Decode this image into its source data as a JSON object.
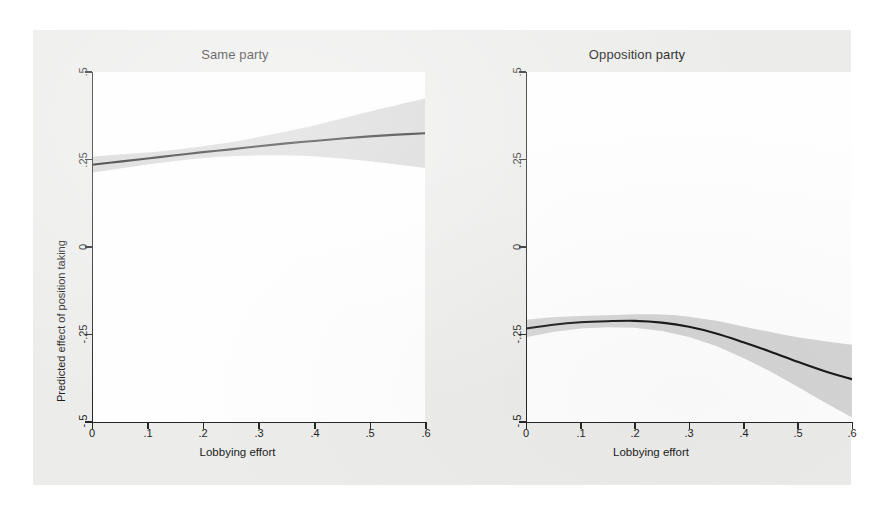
{
  "figure": {
    "background_color": "#ececeb",
    "plot_background_color": "#fefefe",
    "line_color": "#1a1a1a",
    "band_color": "#c9c9c9"
  },
  "chart_data": {
    "type": "line",
    "title": "",
    "subplots": [
      {
        "title": "Same party",
        "xlabel": "Lobbying effort",
        "ylabel": "Predicted effect of position taking",
        "xlim": [
          0,
          0.6
        ],
        "ylim": [
          -0.5,
          0.5
        ],
        "xticks": [
          0,
          0.1,
          0.2,
          0.3,
          0.4,
          0.5,
          0.6
        ],
        "xticklabels": [
          "0",
          ".1",
          ".2",
          ".3",
          ".4",
          ".5",
          ".6"
        ],
        "yticks": [
          -0.5,
          -0.25,
          0,
          0.25,
          0.5
        ],
        "yticklabels": [
          "-.5",
          "-.25",
          "0",
          ".25",
          ".5"
        ],
        "grid": false,
        "series": [
          {
            "name": "Predicted effect",
            "x": [
              0,
              0.05,
              0.1,
              0.15,
              0.2,
              0.25,
              0.3,
              0.35,
              0.4,
              0.45,
              0.5,
              0.55,
              0.6
            ],
            "values": [
              0.235,
              0.244,
              0.253,
              0.262,
              0.271,
              0.279,
              0.288,
              0.296,
              0.303,
              0.31,
              0.316,
              0.321,
              0.325
            ],
            "ci_lower": [
              0.212,
              0.224,
              0.236,
              0.246,
              0.254,
              0.259,
              0.262,
              0.262,
              0.259,
              0.253,
              0.245,
              0.236,
              0.226
            ],
            "ci_upper": [
              0.258,
              0.264,
              0.27,
              0.278,
              0.288,
              0.299,
              0.314,
              0.33,
              0.347,
              0.367,
              0.387,
              0.406,
              0.424
            ]
          }
        ]
      },
      {
        "title": "Opposition party",
        "xlabel": "Lobbying effort",
        "ylabel": "",
        "xlim": [
          0,
          0.6
        ],
        "ylim": [
          -0.5,
          0.5
        ],
        "xticks": [
          0,
          0.1,
          0.2,
          0.3,
          0.4,
          0.5,
          0.6
        ],
        "xticklabels": [
          "0",
          ".1",
          ".2",
          ".3",
          ".4",
          ".5",
          ".6"
        ],
        "yticks": [
          -0.5,
          -0.25,
          0,
          0.25,
          0.5
        ],
        "yticklabels": [
          "-.5",
          "-.25",
          "0",
          ".25",
          ".5"
        ],
        "grid": false,
        "series": [
          {
            "name": "Predicted effect",
            "x": [
              0,
              0.05,
              0.1,
              0.15,
              0.2,
              0.25,
              0.3,
              0.35,
              0.4,
              0.45,
              0.5,
              0.55,
              0.6
            ],
            "values": [
              -0.233,
              -0.222,
              -0.215,
              -0.212,
              -0.211,
              -0.216,
              -0.228,
              -0.247,
              -0.272,
              -0.299,
              -0.328,
              -0.355,
              -0.378
            ],
            "ci_lower": [
              -0.258,
              -0.243,
              -0.233,
              -0.229,
              -0.231,
              -0.24,
              -0.257,
              -0.283,
              -0.317,
              -0.356,
              -0.399,
              -0.444,
              -0.487
            ],
            "ci_upper": [
              -0.208,
              -0.201,
              -0.197,
              -0.195,
              -0.192,
              -0.193,
              -0.199,
              -0.211,
              -0.227,
              -0.243,
              -0.258,
              -0.269,
              -0.279
            ]
          }
        ]
      }
    ]
  }
}
